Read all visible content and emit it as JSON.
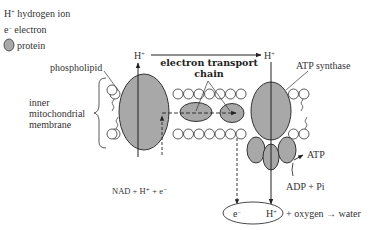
{
  "legend": {
    "items": [
      {
        "symbol": "H⁺",
        "label": "hydrogen ion"
      },
      {
        "symbol": "e⁻",
        "label": "electron"
      },
      {
        "symbol": "protein-icon",
        "label": "protein"
      }
    ]
  },
  "labels": {
    "phospholipid": "phospholipid",
    "membrane_line1": "inner",
    "membrane_line2": "mitochondrial",
    "membrane_line3": "membrane",
    "etc_line1": "electron transport",
    "etc_line2": "chain",
    "atp_synthase": "ATP synthase",
    "atp": "ATP",
    "adp_pi": "ADP + Pi",
    "nad": "NAD + H⁺ + e⁻",
    "h_plus_top_left": "H⁺",
    "h_plus_top_right": "H⁺",
    "e_bottom": "e⁻",
    "h_bottom": "H⁺",
    "oxygen_water": "+ oxygen → water"
  },
  "colors": {
    "protein_fill": "#a8a8a8",
    "stroke": "#333333",
    "background": "#ffffff"
  }
}
